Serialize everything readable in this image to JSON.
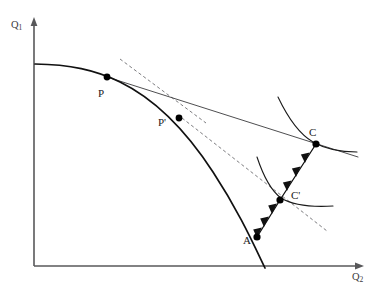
{
  "figure": {
    "width": 378,
    "height": 298,
    "background": "#ffffff"
  },
  "axes": {
    "y_label_text": "Q",
    "y_label_sub": "1",
    "x_label_text": "Q",
    "x_label_sub": "2",
    "color": "#58585a",
    "origin": {
      "x": 34,
      "y": 266
    },
    "y_top": {
      "x": 34,
      "y": 18
    },
    "x_right": {
      "x": 363,
      "y": 266
    }
  },
  "points": [
    {
      "id": "P",
      "label": "P",
      "x": 107,
      "y": 77,
      "label_x": 98,
      "label_y": 88,
      "radius": 3.4
    },
    {
      "id": "Pp",
      "label": "P'",
      "x": 179,
      "y": 118,
      "label_x": 158,
      "label_y": 117,
      "radius": 3.4
    },
    {
      "id": "C",
      "label": "C",
      "x": 316,
      "y": 144,
      "label_x": 309,
      "label_y": 127,
      "radius": 3.6
    },
    {
      "id": "Cp",
      "label": "C'",
      "x": 280,
      "y": 200,
      "label_x": 291,
      "label_y": 190,
      "radius": 3.6
    },
    {
      "id": "A",
      "label": "A",
      "x": 257,
      "y": 237,
      "label_x": 243,
      "label_y": 235,
      "radius": 3.6
    }
  ],
  "curves": {
    "ppf": {
      "name": "production-possibility-frontier",
      "color": "#111111",
      "path": "M 35 64 C 70 64.5 95 70 120 82 C 155 99 185 129 213 172 C 238 210 253 243 265 268"
    },
    "budget_line_solid": {
      "name": "terms-of-trade-line",
      "color": "#3a3a3c",
      "x1": 107,
      "y1": 77,
      "x2": 358,
      "y2": 157
    },
    "tangent_dashed_at_p": {
      "name": "autarky-price-tangent-at-P",
      "color": "#6d6d70",
      "x1": 120,
      "y1": 59,
      "x2": 206,
      "y2": 123
    },
    "dashed_through_cprime": {
      "name": "autarky-price-tangent-at-Pprime",
      "color": "#6d6d70",
      "x1": 182,
      "y1": 118,
      "x2": 327,
      "y2": 231
    },
    "indifference_high": {
      "name": "indifference-curve-at-C",
      "color": "#1a1a1a",
      "path": "M 278 97 C 288 118 299 134 313 142 C 327 150 344 152 357 152"
    },
    "indifference_low": {
      "name": "indifference-curve-at-Cprime",
      "color": "#1a1a1a",
      "path": "M 257 157 C 263 175 270 190 281 198 C 294 206 316 207 333 206"
    }
  },
  "flow": {
    "name": "trade-vector-arrow-chain",
    "color": "#111111",
    "path_points": [
      {
        "x": 316,
        "y": 144
      },
      {
        "x": 280,
        "y": 200
      },
      {
        "x": 257,
        "y": 237
      }
    ],
    "arrowheads": [
      {
        "x": 307,
        "y": 158,
        "angle": 122
      },
      {
        "x": 298,
        "y": 172,
        "angle": 122
      },
      {
        "x": 289,
        "y": 186,
        "angle": 122
      },
      {
        "x": 274,
        "y": 210,
        "angle": 122
      },
      {
        "x": 266,
        "y": 223,
        "angle": 122
      },
      {
        "x": 259,
        "y": 234,
        "angle": 122
      }
    ]
  }
}
